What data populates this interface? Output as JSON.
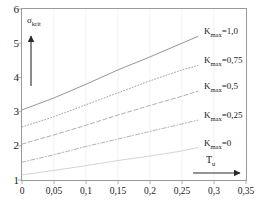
{
  "chart_data": {
    "type": "line",
    "title": "",
    "xlabel": "T_u",
    "ylabel": "sigma_krit",
    "xlabel_html": "T<sub>u</sub>",
    "ylabel_html": "σ<sub>krit</sub>",
    "xlim": [
      0,
      0.35
    ],
    "ylim": [
      1,
      6
    ],
    "grid": true,
    "legend_position": "inline-right-of-curves",
    "x_ticks": [
      "0",
      "0,05",
      "0,1",
      "0,15",
      "0,2",
      "0,25",
      "0,3",
      "0,35"
    ],
    "x_tick_values": [
      0,
      0.05,
      0.1,
      0.15,
      0.2,
      0.25,
      0.3,
      0.35
    ],
    "y_ticks": [
      "1",
      "2",
      "3",
      "4",
      "5",
      "6"
    ],
    "y_tick_values": [
      1,
      2,
      3,
      4,
      5,
      6
    ],
    "series": [
      {
        "name": "K_max=1,0",
        "label_html": "K<sub>max</sub>=1,0",
        "style": "solid",
        "color": "#8a8a8a",
        "x": [
          0,
          0.05,
          0.1,
          0.15,
          0.2,
          0.25,
          0.275
        ],
        "values": [
          3.05,
          3.4,
          3.8,
          4.22,
          4.6,
          5.0,
          5.2
        ]
      },
      {
        "name": "K_max=0,75",
        "label_html": "K<sub>max</sub>=0,75",
        "style": "dotted",
        "color": "#9b9b9b",
        "x": [
          0,
          0.05,
          0.1,
          0.15,
          0.2,
          0.25,
          0.275
        ],
        "values": [
          2.55,
          2.85,
          3.2,
          3.55,
          3.9,
          4.22,
          4.35
        ]
      },
      {
        "name": "K_max=0,5",
        "label_html": "K<sub>max</sub>=0,5",
        "style": "dashed",
        "color": "#a5a5a5",
        "x": [
          0,
          0.05,
          0.1,
          0.15,
          0.2,
          0.25,
          0.275
        ],
        "values": [
          2.05,
          2.32,
          2.6,
          2.9,
          3.18,
          3.45,
          3.6
        ]
      },
      {
        "name": "K_max=0,25",
        "label_html": "K<sub>max</sub>=0,25",
        "style": "dashdot",
        "color": "#aaaaaa",
        "x": [
          0,
          0.05,
          0.1,
          0.15,
          0.2,
          0.25,
          0.275
        ],
        "values": [
          1.52,
          1.74,
          1.98,
          2.2,
          2.42,
          2.64,
          2.75
        ]
      },
      {
        "name": "K_max=0",
        "label_html": "K<sub>max</sub>=0",
        "style": "solid",
        "color": "#cfcfcf",
        "x": [
          0,
          0.05,
          0.1,
          0.15,
          0.2,
          0.25,
          0.275
        ],
        "values": [
          1.15,
          1.28,
          1.42,
          1.57,
          1.7,
          1.85,
          1.95
        ]
      }
    ],
    "annotations": [
      {
        "name": "y-axis-arrow",
        "direction": "up",
        "text": ""
      },
      {
        "name": "x-axis-arrow",
        "direction": "right",
        "text": ""
      }
    ]
  }
}
